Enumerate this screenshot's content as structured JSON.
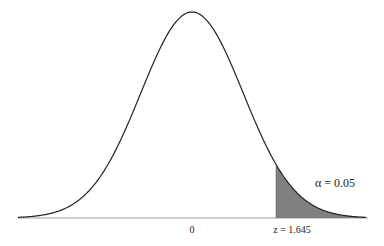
{
  "chart_data": {
    "type": "area",
    "title": "",
    "distribution": "standard normal",
    "mean": 0,
    "sd": 1,
    "x_range": [
      -3.4,
      3.4
    ],
    "shaded_region": {
      "from": 1.645,
      "to": 3.4,
      "color": "#808080"
    },
    "annotations": [
      {
        "text": "α = 0.05",
        "x": 2.4,
        "position": "right tail"
      }
    ],
    "tick_labels": [
      {
        "value": 0,
        "label": "0"
      },
      {
        "value": 1.645,
        "label": "z = 1.645"
      }
    ],
    "xlabel": "",
    "ylabel": "",
    "grid": false,
    "legend": null
  },
  "colors": {
    "curve": "#222222",
    "shade": "#808080",
    "axis": "#9a9a9a"
  }
}
